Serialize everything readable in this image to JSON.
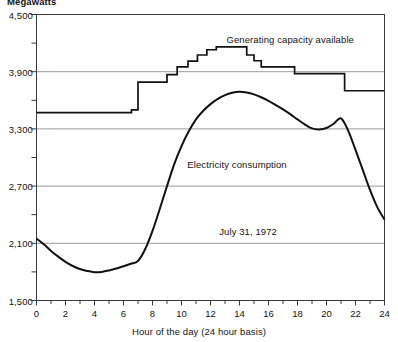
{
  "chart_data": {
    "type": "line",
    "title": "",
    "unit_label": "Megawatts",
    "xlabel": "Hour of the day (24 hour basis)",
    "ylabel": "Megawatts",
    "xlim": [
      0,
      24
    ],
    "ylim": [
      1500,
      4500
    ],
    "grid": "horizontal",
    "legend": "inline-annotations",
    "y_ticks": [
      1500,
      2100,
      2700,
      3300,
      3900,
      4500
    ],
    "y_tick_labels": [
      "1,500",
      "2,100",
      "2,700",
      "3,300",
      "3,900",
      "4,500"
    ],
    "y_minor_ticks": [
      1800,
      2400,
      3000,
      3600,
      4200
    ],
    "x_ticks": [
      0,
      2,
      4,
      6,
      8,
      10,
      12,
      14,
      16,
      18,
      20,
      22,
      24
    ],
    "x_tick_labels": [
      "0",
      "2",
      "4",
      "6",
      "8",
      "10",
      "12",
      "14",
      "16",
      "18",
      "20",
      "22",
      "24"
    ],
    "x_minor_ticks": [
      1,
      3,
      5,
      7,
      9,
      11,
      13,
      15,
      17,
      19,
      21,
      23
    ],
    "annotations": [
      {
        "text": "Generating capacity available",
        "x": 13.1,
        "y": 4230
      },
      {
        "text": "Electricity consumption",
        "x": 10.4,
        "y": 2920
      },
      {
        "text": "July 31, 1972",
        "x": 12.6,
        "y": 2220
      }
    ],
    "series": [
      {
        "name": "Generating capacity available",
        "style": "step",
        "color": "#111111",
        "x": [
          0,
          6.55,
          6.55,
          7.0,
          7.0,
          9.0,
          9.0,
          9.7,
          9.7,
          10.45,
          10.45,
          11.1,
          11.1,
          11.75,
          11.75,
          12.4,
          12.4,
          14.5,
          14.5,
          15.0,
          15.0,
          15.5,
          15.5,
          17.8,
          17.8,
          21.25,
          21.25,
          24
        ],
        "y": [
          3470,
          3470,
          3500,
          3500,
          3790,
          3790,
          3870,
          3870,
          3950,
          3950,
          4010,
          4010,
          4075,
          4075,
          4130,
          4130,
          4160,
          4160,
          4075,
          4075,
          4015,
          4015,
          3950,
          3950,
          3880,
          3880,
          3700,
          3700
        ]
      },
      {
        "name": "Electricity consumption",
        "style": "smooth",
        "color": "#111111",
        "x": [
          0,
          0.5,
          1,
          1.5,
          2,
          2.5,
          3,
          3.5,
          4,
          4.5,
          5,
          5.5,
          6,
          6.5,
          7,
          7.5,
          8,
          8.5,
          9,
          9.5,
          10,
          10.5,
          11,
          11.5,
          12,
          12.5,
          13,
          13.5,
          14,
          14.5,
          15,
          15.5,
          16,
          16.5,
          17,
          17.5,
          18,
          18.5,
          19,
          19.5,
          20,
          20.5,
          21,
          21.5,
          22,
          22.5,
          23,
          23.5,
          24
        ],
        "y": [
          2150,
          2090,
          2020,
          1960,
          1905,
          1862,
          1830,
          1810,
          1797,
          1800,
          1815,
          1835,
          1860,
          1885,
          1915,
          2040,
          2230,
          2460,
          2700,
          2930,
          3120,
          3275,
          3400,
          3490,
          3560,
          3615,
          3655,
          3680,
          3690,
          3682,
          3662,
          3632,
          3595,
          3550,
          3505,
          3455,
          3400,
          3348,
          3305,
          3295,
          3310,
          3355,
          3410,
          3280,
          3080,
          2870,
          2660,
          2480,
          2350
        ]
      }
    ]
  },
  "axes": {
    "frame_color": "#3a3a3a",
    "grid_color": "#9a9a9a"
  }
}
